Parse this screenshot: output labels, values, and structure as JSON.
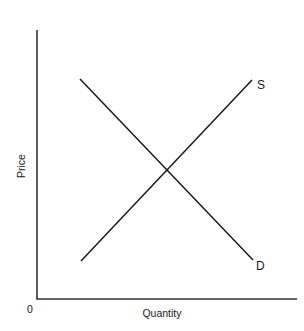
{
  "diagram": {
    "type": "supply-demand",
    "title": "",
    "origin_label": "0",
    "x_axis": {
      "label": "Quantity"
    },
    "y_axis": {
      "label": "Price"
    },
    "curves": [
      {
        "name": "supply",
        "label": "S",
        "direction": "upward-sloping"
      },
      {
        "name": "demand",
        "label": "D",
        "direction": "downward-sloping"
      }
    ],
    "equilibrium": {
      "shown_as": "intersection of S and D",
      "marked": false
    },
    "colors": {
      "background": "#ffffff",
      "axis": "#333333",
      "curve": "#1a1a1a",
      "text": "#1a1a1a"
    }
  }
}
